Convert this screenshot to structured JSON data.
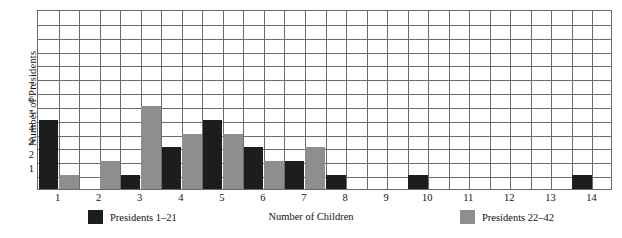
{
  "chart_data": {
    "type": "bar",
    "title": "",
    "xlabel": "Number of Children",
    "ylabel": "Number of Presidents",
    "categories": [
      "1",
      "2",
      "3",
      "4",
      "5",
      "6",
      "7",
      "8",
      "9",
      "10",
      "11",
      "12",
      "13",
      "14"
    ],
    "series": [
      {
        "name": "Presidents 1–21",
        "color": "#1d1d1d",
        "values": [
          5,
          0,
          1,
          3,
          5,
          3,
          2,
          1,
          0,
          1,
          0,
          0,
          0,
          1
        ]
      },
      {
        "name": "Presidents 22–42",
        "color": "#8e8e8e",
        "values": [
          1,
          2,
          6,
          4,
          4,
          2,
          3,
          0,
          0,
          0,
          0,
          0,
          0,
          0
        ]
      }
    ],
    "ylim": [
      0,
      13
    ],
    "ytick_labels": [
      "1",
      "2",
      "3",
      "4",
      "5",
      "6",
      "7"
    ],
    "ytick_values": [
      1,
      2,
      3,
      4,
      5,
      6,
      7
    ],
    "grid": true,
    "grid_rows": 13,
    "grid_cols": 28,
    "legend_position": "bottom"
  },
  "legend": {
    "entries": [
      {
        "label": "Presidents 1–21",
        "color": "#1d1d1d"
      },
      {
        "label": "Presidents 22–42",
        "color": "#8e8e8e"
      }
    ]
  },
  "axis": {
    "x_title": "Number of Children",
    "y_title": "Number of Presidents"
  }
}
